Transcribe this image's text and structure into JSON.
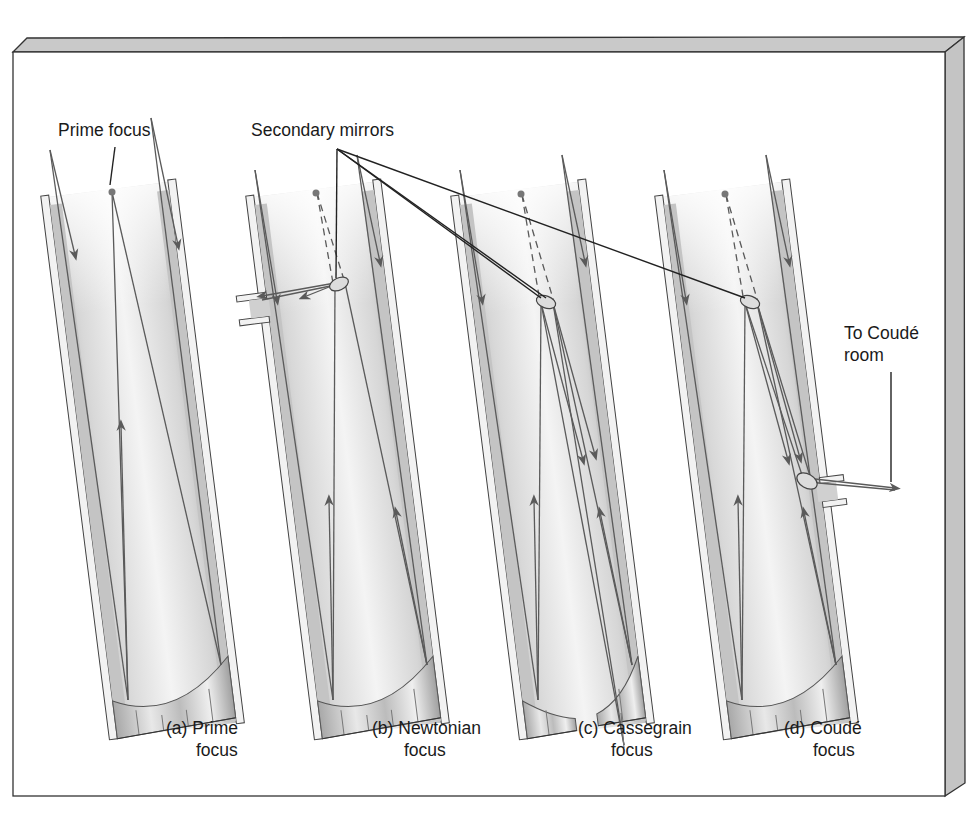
{
  "figure": {
    "callouts": {
      "prime_focus": "Prime focus",
      "secondary_mirrors": "Secondary mirrors",
      "to_coude_room_line1": "To Coudé",
      "to_coude_room_line2": "room"
    },
    "panels": [
      {
        "id": "a",
        "caption_line1": "(a) Prime",
        "caption_line2": "focus"
      },
      {
        "id": "b",
        "caption_line1": "(b) Newtonian",
        "caption_line2": "focus"
      },
      {
        "id": "c",
        "caption_line1": "(c) Cassegrain",
        "caption_line2": "focus"
      },
      {
        "id": "d",
        "caption_line1": "(d) Coudé",
        "caption_line2": "focus"
      }
    ],
    "colors": {
      "frame_face": "#ffffff",
      "frame_bevel": "#c8c8c8",
      "frame_edge": "#333333",
      "tube_fill": "#d9d9d9",
      "tube_wall": "#a9a9a9",
      "ray": "#5a5a5a",
      "callout_line": "#222222"
    }
  }
}
